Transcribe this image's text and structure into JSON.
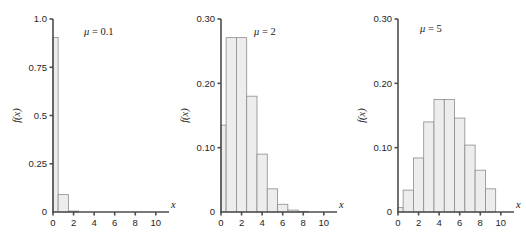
{
  "figure": {
    "name": "poisson-distribution-panels",
    "background_color": "#ffffff",
    "bar_fill_color": "#ededed",
    "bar_edge_color": "#8c8c8c",
    "axis_color": "#4d4d4d",
    "text_color": "#1a1a1a"
  },
  "chart_data": [
    {
      "type": "bar",
      "title": "",
      "annotation": "μ = 0.1",
      "annotation_symbol": "μ",
      "annotation_value": "0.1",
      "xlabel": "x",
      "ylabel": "f(x)",
      "xlim": [
        0,
        10.6
      ],
      "ylim": [
        0,
        1.0
      ],
      "grid": false,
      "legend": "none",
      "xticks": [
        0,
        2,
        4,
        6,
        8,
        10
      ],
      "xticklabels": [
        "0",
        "2",
        "4",
        "6",
        "8",
        "10"
      ],
      "yticks": [
        0,
        0.25,
        0.5,
        0.75,
        1.0
      ],
      "yticklabels": [
        "0",
        "0.25",
        "0.5",
        "0.75",
        "1.0"
      ],
      "categories": [
        0,
        1,
        2,
        3,
        4,
        5,
        6,
        7,
        8,
        9
      ],
      "values": [
        0.905,
        0.09,
        0.005,
        0.0,
        0.0,
        0.0,
        0.0,
        0.0,
        0.0,
        0.0
      ]
    },
    {
      "type": "bar",
      "title": "",
      "annotation": "μ = 2",
      "annotation_symbol": "μ",
      "annotation_value": "2",
      "xlabel": "x",
      "ylabel": "f(x)",
      "xlim": [
        0,
        10.6
      ],
      "ylim": [
        0,
        0.3
      ],
      "grid": false,
      "legend": "none",
      "xticks": [
        0,
        2,
        4,
        6,
        8,
        10
      ],
      "xticklabels": [
        "0",
        "2",
        "4",
        "6",
        "8",
        "10"
      ],
      "yticks": [
        0,
        0.1,
        0.2,
        0.3
      ],
      "yticklabels": [
        "0",
        "0.10",
        "0.20",
        "0.30"
      ],
      "categories": [
        0,
        1,
        2,
        3,
        4,
        5,
        6,
        7,
        8,
        9
      ],
      "values": [
        0.135,
        0.271,
        0.271,
        0.18,
        0.09,
        0.036,
        0.012,
        0.003,
        0.001,
        0.0
      ]
    },
    {
      "type": "bar",
      "title": "",
      "annotation": "μ = 5",
      "annotation_symbol": "μ",
      "annotation_value": "5",
      "xlabel": "x",
      "ylabel": "f(x)",
      "xlim": [
        0,
        10.6
      ],
      "ylim": [
        0,
        0.3
      ],
      "grid": false,
      "legend": "none",
      "xticks": [
        0,
        2,
        4,
        6,
        8,
        10
      ],
      "xticklabels": [
        "0",
        "2",
        "4",
        "6",
        "8",
        "10"
      ],
      "yticks": [
        0,
        0.1,
        0.2,
        0.3
      ],
      "yticklabels": [
        "0",
        "0.10",
        "0.20",
        "0.30"
      ],
      "categories": [
        0,
        1,
        2,
        3,
        4,
        5,
        6,
        7,
        8,
        9
      ],
      "values": [
        0.007,
        0.034,
        0.084,
        0.14,
        0.175,
        0.175,
        0.146,
        0.104,
        0.065,
        0.036
      ]
    }
  ]
}
